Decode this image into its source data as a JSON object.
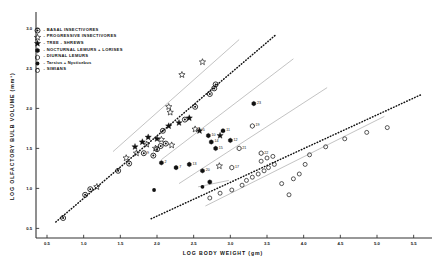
{
  "figure": {
    "xlabel": "LOG  BODY  WEIGHT  (gm)",
    "ylabel": "LOG  OLFACTORY  BULB  VOLUME  (mm³)"
  },
  "legend": {
    "items": [
      {
        "symbol": "bullseye",
        "dash": "-",
        "label": "BASAL INSECTIVORES"
      },
      {
        "symbol": "open-star",
        "dash": "-",
        "label": "PROGRESSIVE INSECTIVORES"
      },
      {
        "symbol": "filled-star",
        "dash": "-",
        "label": "TREE - SHREWS"
      },
      {
        "symbol": "filled-hex",
        "dash": "-",
        "label": "NOCTURNAL LEMURS + LORISES"
      },
      {
        "symbol": "open-hex",
        "dash": "-",
        "label": "DIURNAL LEMURS"
      },
      {
        "symbol": "filled-circle",
        "dash": "-",
        "label": "Tarsius + Nycticebus"
      },
      {
        "symbol": "open-circle",
        "dash": "-",
        "label": "SIMIANS"
      }
    ]
  },
  "chart_data": {
    "type": "scatter",
    "title": "",
    "xlabel": "LOG  BODY  WEIGHT  (gm)",
    "ylabel": "LOG  OLFACTORY  BULB  VOLUME  (mm³)",
    "xlim": [
      0.35,
      5.75
    ],
    "ylim": [
      0.38,
      3.18
    ],
    "xticks": [
      0.5,
      1.0,
      1.5,
      2.0,
      2.5,
      3.0,
      3.5,
      4.0,
      4.5,
      5.0,
      5.5
    ],
    "yticks": [
      0.5,
      1.0,
      1.5,
      2.0,
      2.5,
      3.0
    ],
    "grid": false,
    "legend_position": "upper-left",
    "series": [
      {
        "name": "BASAL INSECTIVORES",
        "symbol": "bullseye",
        "points": [
          {
            "x": 0.72,
            "y": 0.63
          },
          {
            "x": 1.02,
            "y": 0.92
          },
          {
            "x": 1.09,
            "y": 0.99
          },
          {
            "x": 1.47,
            "y": 1.22
          },
          {
            "x": 1.62,
            "y": 1.31
          },
          {
            "x": 1.82,
            "y": 1.44,
            "label": "9"
          },
          {
            "x": 1.95,
            "y": 1.41
          },
          {
            "x": 2.0,
            "y": 1.49
          },
          {
            "x": 2.05,
            "y": 1.53
          },
          {
            "x": 2.12,
            "y": 1.56
          },
          {
            "x": 2.08,
            "y": 1.72
          },
          {
            "x": 2.38,
            "y": 1.86
          },
          {
            "x": 2.52,
            "y": 2.02
          },
          {
            "x": 2.72,
            "y": 2.18
          },
          {
            "x": 2.78,
            "y": 2.25
          },
          {
            "x": 2.8,
            "y": 2.3
          }
        ]
      },
      {
        "name": "PROGRESSIVE INSECTIVORES",
        "symbol": "open-star",
        "points": [
          {
            "x": 1.18,
            "y": 1.02
          },
          {
            "x": 1.58,
            "y": 1.38
          },
          {
            "x": 1.72,
            "y": 1.44
          },
          {
            "x": 1.86,
            "y": 1.55
          },
          {
            "x": 1.98,
            "y": 1.5
          },
          {
            "x": 2.06,
            "y": 1.61
          },
          {
            "x": 2.2,
            "y": 1.54
          },
          {
            "x": 2.18,
            "y": 1.95
          },
          {
            "x": 2.16,
            "y": 2.02
          },
          {
            "x": 2.34,
            "y": 2.42
          },
          {
            "x": 2.62,
            "y": 2.58
          },
          {
            "x": 2.52,
            "y": 1.74,
            "label": "5"
          },
          {
            "x": 2.85,
            "y": 1.28
          }
        ]
      },
      {
        "name": "TREE - SHREWS",
        "symbol": "filled-star",
        "points": [
          {
            "x": 1.7,
            "y": 1.52
          },
          {
            "x": 1.8,
            "y": 1.58
          },
          {
            "x": 1.88,
            "y": 1.64
          },
          {
            "x": 2.0,
            "y": 1.62
          },
          {
            "x": 2.16,
            "y": 1.78
          },
          {
            "x": 2.3,
            "y": 1.82
          },
          {
            "x": 2.44,
            "y": 1.88
          },
          {
            "x": 2.58,
            "y": 1.72,
            "label": "5"
          },
          {
            "x": 2.86,
            "y": 1.66
          }
        ]
      },
      {
        "name": "NOCTURNAL LEMURS + LORISES",
        "symbol": "filled-hex",
        "points": [
          {
            "x": 2.06,
            "y": 1.32,
            "label": "2"
          },
          {
            "x": 2.26,
            "y": 1.26,
            "label": "7"
          },
          {
            "x": 2.44,
            "y": 1.3,
            "label": "13"
          },
          {
            "x": 2.7,
            "y": 1.66,
            "label": "10"
          },
          {
            "x": 2.74,
            "y": 1.58,
            "label": "14"
          },
          {
            "x": 2.8,
            "y": 1.5,
            "label": "15"
          },
          {
            "x": 2.9,
            "y": 1.72,
            "label": "11"
          },
          {
            "x": 3.0,
            "y": 1.6,
            "label": "12"
          },
          {
            "x": 2.62,
            "y": 1.22,
            "label": "20"
          },
          {
            "x": 2.72,
            "y": 1.08
          },
          {
            "x": 3.32,
            "y": 2.06,
            "label": "23"
          }
        ]
      },
      {
        "name": "DIURNAL LEMURS",
        "symbol": "open-hex",
        "points": [
          {
            "x": 3.3,
            "y": 1.78,
            "label": "19"
          },
          {
            "x": 3.12,
            "y": 1.5,
            "label": "21"
          },
          {
            "x": 3.42,
            "y": 1.44,
            "label": "22"
          },
          {
            "x": 3.02,
            "y": 1.26,
            "label": "17"
          }
        ]
      },
      {
        "name": "Tarsius + Nycticebus",
        "symbol": "filled-circle",
        "points": [
          {
            "x": 1.96,
            "y": 0.98
          },
          {
            "x": 2.62,
            "y": 1.02
          }
        ]
      },
      {
        "name": "SIMIANS",
        "symbol": "open-circle",
        "points": [
          {
            "x": 2.72,
            "y": 0.88
          },
          {
            "x": 2.86,
            "y": 0.94
          },
          {
            "x": 3.02,
            "y": 0.98
          },
          {
            "x": 3.16,
            "y": 1.04
          },
          {
            "x": 3.22,
            "y": 1.1
          },
          {
            "x": 3.3,
            "y": 1.14
          },
          {
            "x": 3.38,
            "y": 1.18
          },
          {
            "x": 3.46,
            "y": 1.22
          },
          {
            "x": 3.52,
            "y": 1.26
          },
          {
            "x": 3.6,
            "y": 1.3
          },
          {
            "x": 3.42,
            "y": 1.34
          },
          {
            "x": 3.5,
            "y": 1.38
          },
          {
            "x": 3.58,
            "y": 1.4
          },
          {
            "x": 3.7,
            "y": 1.06
          },
          {
            "x": 3.86,
            "y": 1.12
          },
          {
            "x": 3.94,
            "y": 1.18
          },
          {
            "x": 4.08,
            "y": 1.42
          },
          {
            "x": 4.3,
            "y": 1.52
          },
          {
            "x": 4.56,
            "y": 1.62
          },
          {
            "x": 4.86,
            "y": 1.7
          },
          {
            "x": 5.14,
            "y": 1.76
          },
          {
            "x": 4.02,
            "y": 1.3
          },
          {
            "x": 3.8,
            "y": 0.92
          }
        ]
      }
    ],
    "regression_lines": [
      {
        "name": "insectivore-dotted",
        "style": "dotted",
        "x1": 0.62,
        "y1": 0.58,
        "x2": 3.62,
        "y2": 2.92
      },
      {
        "name": "simian-dotted",
        "style": "dotted",
        "x1": 1.92,
        "y1": 0.62,
        "x2": 5.62,
        "y2": 2.18
      },
      {
        "name": "upper-solid-1",
        "style": "solid",
        "x1": 1.4,
        "y1": 1.46,
        "x2": 3.12,
        "y2": 2.86
      },
      {
        "name": "upper-solid-2",
        "style": "solid",
        "x1": 2.06,
        "y1": 1.36,
        "x2": 3.86,
        "y2": 2.62
      },
      {
        "name": "mid-solid-3",
        "style": "solid",
        "x1": 2.3,
        "y1": 1.06,
        "x2": 4.32,
        "y2": 2.26
      },
      {
        "name": "low-solid-4",
        "style": "solid",
        "x1": 2.66,
        "y1": 0.78,
        "x2": 5.1,
        "y2": 1.9
      },
      {
        "name": "short-solid-5",
        "style": "solid",
        "x1": 2.56,
        "y1": 1.02,
        "x2": 2.98,
        "y2": 1.1
      }
    ]
  }
}
